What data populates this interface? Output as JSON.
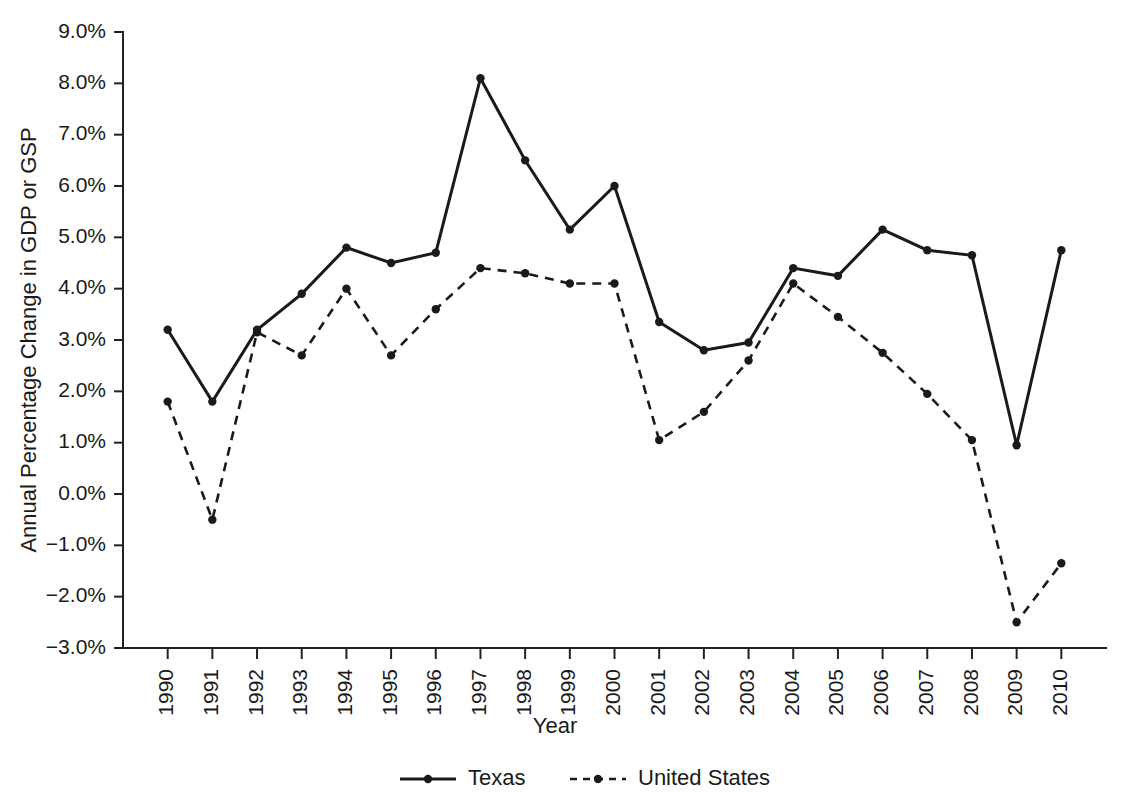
{
  "chart_data": {
    "type": "line",
    "title": "",
    "xlabel": "Year",
    "ylabel": "Annual Percentage Change in GDP or GSP",
    "categories": [
      "1990",
      "1991",
      "1992",
      "1993",
      "1994",
      "1995",
      "1996",
      "1997",
      "1998",
      "1999",
      "2000",
      "2001",
      "2002",
      "2003",
      "2004",
      "2005",
      "2006",
      "2007",
      "2008",
      "2009",
      "2010"
    ],
    "ytick_labels": [
      "9.0%",
      "8.0%",
      "7.0%",
      "6.0%",
      "5.0%",
      "4.0%",
      "3.0%",
      "2.0%",
      "1.0%",
      "0.0%",
      "-1.0%",
      "-2.0%",
      "-3.0%"
    ],
    "ytick_values": [
      9.0,
      8.0,
      7.0,
      6.0,
      5.0,
      4.0,
      3.0,
      2.0,
      1.0,
      0.0,
      -1.0,
      -2.0,
      -3.0
    ],
    "ylim": [
      -3.0,
      9.0
    ],
    "grid": false,
    "legend_position": "bottom",
    "series": [
      {
        "name": "Texas",
        "style": "solid",
        "color": "#1a1a1a",
        "values": [
          3.2,
          1.8,
          3.2,
          3.9,
          4.8,
          4.5,
          4.7,
          8.1,
          6.5,
          5.15,
          6.0,
          3.35,
          2.8,
          2.95,
          4.4,
          4.25,
          5.15,
          4.75,
          4.65,
          0.95,
          4.75
        ]
      },
      {
        "name": "United States",
        "style": "dashed",
        "color": "#1a1a1a",
        "values": [
          1.8,
          -0.5,
          3.15,
          2.7,
          4.0,
          2.7,
          3.6,
          4.4,
          4.3,
          4.1,
          4.1,
          1.05,
          1.6,
          2.6,
          4.1,
          3.45,
          2.75,
          1.95,
          1.05,
          -2.5,
          -1.35
        ]
      }
    ]
  },
  "legend": {
    "items": [
      {
        "label": "Texas",
        "style": "solid"
      },
      {
        "label": "United States",
        "style": "dashed"
      }
    ]
  }
}
